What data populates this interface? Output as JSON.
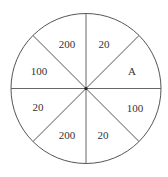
{
  "diagram": {
    "type": "circle-divided-into-8-sectors",
    "center": [
      86,
      88.5
    ],
    "radius": 75,
    "stroke_color": "#555555",
    "sectors": [
      {
        "position": "top-left-upper",
        "label": "200"
      },
      {
        "position": "top-right-upper",
        "label": "20"
      },
      {
        "position": "right-upper",
        "label": "A"
      },
      {
        "position": "right-lower",
        "label": "100"
      },
      {
        "position": "bottom-right",
        "label": "20"
      },
      {
        "position": "bottom-left",
        "label": "200"
      },
      {
        "position": "left-lower",
        "label": "20"
      },
      {
        "position": "left-upper",
        "label": "100"
      }
    ]
  }
}
